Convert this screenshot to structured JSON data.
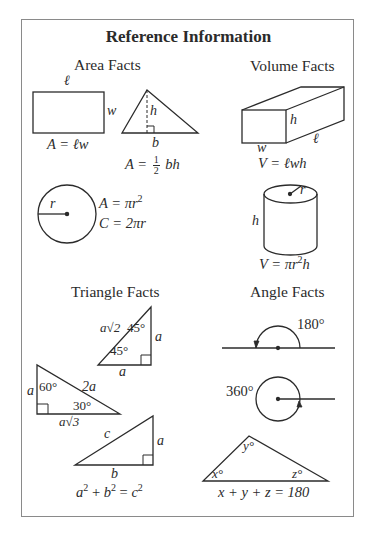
{
  "title": "Reference Information",
  "sections": {
    "area": {
      "heading": "Area Facts",
      "rectangle": {
        "length_label": "ℓ",
        "width_label": "w",
        "formula": "A = ℓw"
      },
      "triangle": {
        "height_label": "h",
        "base_label": "b",
        "formula_prefix": "A = ",
        "fraction_num": "1",
        "fraction_den": "2",
        "formula_suffix": " bh"
      },
      "circle": {
        "radius_label": "r",
        "area_formula_prefix": "A = πr",
        "area_exponent": "2",
        "circumference_formula": "C = 2πr"
      }
    },
    "volume": {
      "heading": "Volume Facts",
      "box": {
        "height_label": "h",
        "length_label": "ℓ",
        "width_label": "w",
        "formula": "V = ℓwh"
      },
      "cylinder": {
        "radius_label": "r",
        "height_label": "h",
        "formula_prefix": "V = πr",
        "formula_exponent": "2",
        "formula_suffix": "h"
      }
    },
    "triangle": {
      "heading": "Triangle Facts",
      "isosceles_right": {
        "hypotenuse_label": "a√2",
        "top_angle": "45°",
        "bottom_angle": "45°",
        "leg_right": "a",
        "leg_bottom": "a"
      },
      "thirty_sixty_ninety": {
        "short_leg": "a",
        "angle_60": "60°",
        "hypotenuse": "2a",
        "angle_30": "30°",
        "long_leg": "a√3"
      },
      "pythagorean": {
        "hyp": "c",
        "leg_a": "a",
        "leg_b": "b",
        "formula_a": "a",
        "formula_b": "b",
        "formula_c": "c",
        "exp": "2"
      }
    },
    "angle": {
      "heading": "Angle Facts",
      "straight_angle": "180°",
      "full_angle": "360°",
      "triangle_angles": {
        "x": "x°",
        "y": "y°",
        "z": "z°",
        "formula": "x + y + z = 180"
      }
    }
  },
  "colors": {
    "ink": "#2b2b2b",
    "border": "#8a8a8a",
    "background": "#ffffff"
  }
}
